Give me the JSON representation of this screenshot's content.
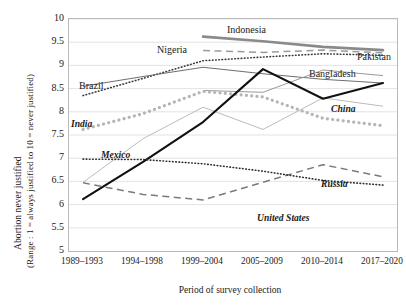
{
  "axes": {
    "y_title_line1": "Abortion never justified",
    "y_title_line2": "(Range : 1 = always justified to 10 = never justified)",
    "x_title": "Period of survey collection",
    "y_ticks": [
      "10",
      "9.5",
      "9",
      "8.5",
      "8",
      "7.5",
      "7",
      "6.5",
      "6",
      "5.5",
      "5"
    ],
    "x_ticks": [
      "1989–1993",
      "1994–1998",
      "1999–2004",
      "2005–2009",
      "2010–2014",
      "2017–2020"
    ]
  },
  "labels": {
    "brazil": "Brazil",
    "nigeria": "Nigeria",
    "indonesia": "Indonesia",
    "pakistan": "Pakistan",
    "bangladesh": "Bangladesh",
    "india": "India",
    "mexico": "Mexico",
    "china": "China",
    "russia": "Russia",
    "united_states": "United States"
  },
  "chart_data": {
    "type": "line",
    "title": "",
    "xlabel": "Period of survey collection",
    "ylabel": "Abortion never justified (Range : 1 = always justified to 10 = never justified)",
    "x": [
      "1989–1993",
      "1994–1998",
      "1999–2004",
      "2005–2009",
      "2010–2014",
      "2017–2020"
    ],
    "ylim": [
      5,
      10
    ],
    "ytick_step": 0.5,
    "grid": true,
    "legend": "inline-labels",
    "series": [
      {
        "name": "Indonesia",
        "color": "#8a8a8a",
        "style": "solid-thick",
        "values": [
          null,
          null,
          9.62,
          9.52,
          9.4,
          9.33
        ]
      },
      {
        "name": "Nigeria",
        "color": "#3a3a3a",
        "style": "dotted",
        "values": [
          8.35,
          8.72,
          9.1,
          9.18,
          9.25,
          9.22
        ]
      },
      {
        "name": "Pakistan",
        "color": "#9a9a9a",
        "style": "dashed",
        "values": [
          null,
          null,
          9.32,
          9.28,
          9.33,
          9.27
        ]
      },
      {
        "name": "Brazil",
        "color": "#6e6e6e",
        "style": "solid",
        "values": [
          8.55,
          8.76,
          8.96,
          8.82,
          8.7,
          8.62
        ]
      },
      {
        "name": "Bangladesh",
        "color": "#9a9a9a",
        "style": "solid",
        "values": [
          null,
          null,
          8.46,
          8.42,
          8.9,
          8.78
        ]
      },
      {
        "name": "India",
        "color": "#b5b5b5",
        "style": "dotted-square",
        "values": [
          7.62,
          7.96,
          8.44,
          8.32,
          7.86,
          7.7
        ]
      },
      {
        "name": "Mexico",
        "color": "#bcbcbc",
        "style": "solid",
        "values": [
          6.48,
          7.42,
          8.1,
          7.62,
          8.3,
          8.12
        ]
      },
      {
        "name": "China",
        "color": "#111111",
        "style": "solid-bold",
        "values": [
          6.12,
          6.92,
          7.78,
          8.92,
          8.28,
          8.62
        ]
      },
      {
        "name": "Russia",
        "color": "#7a7a7a",
        "style": "dashed",
        "values": [
          6.47,
          6.22,
          6.1,
          6.48,
          6.86,
          6.6
        ]
      },
      {
        "name": "United States",
        "color": "#2f2f2f",
        "style": "dotted",
        "values": [
          6.98,
          6.97,
          6.88,
          6.72,
          6.52,
          6.42
        ]
      }
    ]
  }
}
